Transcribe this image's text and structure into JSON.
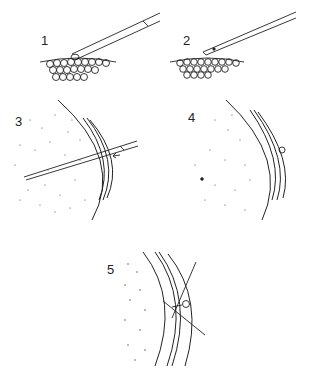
{
  "figure": {
    "panels": [
      {
        "id": "1",
        "label": "1",
        "description": "Micropipette approaching embryo surface cells, cell aspirated at tip"
      },
      {
        "id": "2",
        "label": "2",
        "description": "Cell drawn into micropipette, pipette lifted away from cell layer"
      },
      {
        "id": "3",
        "label": "3",
        "description": "Pipette inserted through membranes into blastocoel/yolk region; arrow indicates direction"
      },
      {
        "id": "4",
        "label": "4",
        "description": "Cell deposited inside (dot); small bleb at entry point"
      },
      {
        "id": "5",
        "label": "5",
        "description": "Crossed lines at entry site with small bulge on membrane"
      }
    ],
    "colors": {
      "ink": "#222222",
      "background": "#ffffff"
    }
  }
}
